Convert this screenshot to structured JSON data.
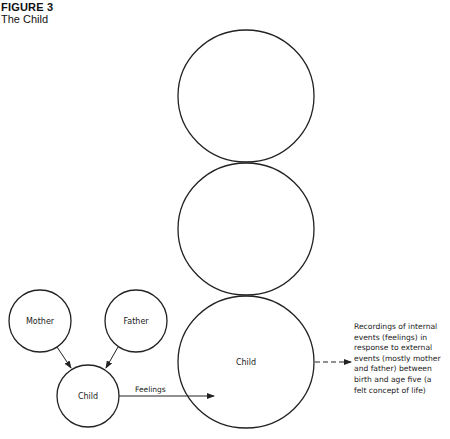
{
  "figure": {
    "label": "FIGURE 3",
    "title": "The Child"
  },
  "stacked_circles": [
    {
      "id": "top",
      "label": "",
      "cx": 246,
      "cy": 96,
      "rx": 68,
      "ry": 66
    },
    {
      "id": "middle",
      "label": "",
      "cx": 246,
      "cy": 229,
      "rx": 68,
      "ry": 66
    },
    {
      "id": "bottom",
      "label": "Child",
      "cx": 246,
      "cy": 362,
      "rx": 68,
      "ry": 66
    }
  ],
  "small_nodes": [
    {
      "id": "mother",
      "label": "Mother",
      "cx": 40,
      "cy": 321,
      "r": 31
    },
    {
      "id": "father",
      "label": "Father",
      "cx": 136,
      "cy": 321,
      "r": 31
    },
    {
      "id": "child",
      "label": "Child",
      "cx": 88,
      "cy": 396,
      "r": 31
    }
  ],
  "edges": [
    {
      "from": "mother",
      "to": "child",
      "label": "",
      "style": "solid"
    },
    {
      "from": "father",
      "to": "child",
      "label": "",
      "style": "solid"
    },
    {
      "from": "child",
      "to": "bottom",
      "label": "Feelings",
      "style": "solid"
    },
    {
      "from": "bottom",
      "to": "description",
      "label": "",
      "style": "dashed"
    }
  ],
  "feelings_label": "Feelings",
  "big_child_label": "Child",
  "description": {
    "lines": [
      "Recordings of internal",
      "events (feelings) in",
      "response to external",
      "events (mostly mother",
      "and father) between",
      "birth and age five (a",
      "felt concept of life)"
    ]
  }
}
